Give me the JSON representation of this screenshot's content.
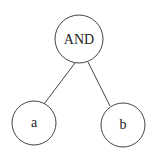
{
  "diagram": {
    "type": "tree",
    "nodes": [
      {
        "id": "and",
        "label": "AND",
        "cx": 79,
        "cy": 39,
        "r": 24
      },
      {
        "id": "a",
        "label": "a",
        "cx": 34,
        "cy": 123,
        "r": 22
      },
      {
        "id": "b",
        "label": "b",
        "cx": 123,
        "cy": 125,
        "r": 22
      }
    ],
    "edges": [
      {
        "from": "and",
        "to": "a"
      },
      {
        "from": "and",
        "to": "b"
      }
    ],
    "stroke_color": "#444444"
  }
}
